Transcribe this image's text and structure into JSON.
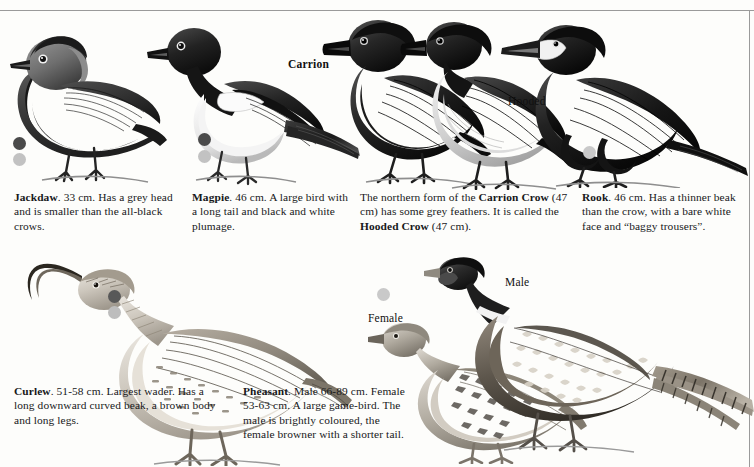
{
  "page": {
    "background_color": "#fdfdfb",
    "rule_color": "#9a9a9a"
  },
  "picture_labels": [
    {
      "id": "carrion",
      "text": "Carrion",
      "bold": true,
      "x": 288,
      "y": 58
    },
    {
      "id": "hooded",
      "text": "Hooded",
      "bold": false,
      "x": 508,
      "y": 95
    },
    {
      "id": "male",
      "text": "Male",
      "bold": false,
      "x": 505,
      "y": 276
    },
    {
      "id": "female",
      "text": "Female",
      "bold": false,
      "x": 368,
      "y": 312
    }
  ],
  "dots": [
    {
      "id": "jackdaw-dot-dark",
      "color": "#4a4a4a",
      "x": 13,
      "y": 137,
      "size": 13
    },
    {
      "id": "jackdaw-dot-light",
      "color": "#c2c2c2",
      "x": 13,
      "y": 153,
      "size": 13
    },
    {
      "id": "magpie-dot-dark",
      "color": "#4a4a4a",
      "x": 198,
      "y": 133,
      "size": 13
    },
    {
      "id": "magpie-dot-light",
      "color": "#c2c2c2",
      "x": 198,
      "y": 150,
      "size": 13
    },
    {
      "id": "rook-dot-light",
      "color": "#c9c9c9",
      "x": 583,
      "y": 146,
      "size": 13
    },
    {
      "id": "curlew-dot-dark",
      "color": "#585858",
      "x": 108,
      "y": 290,
      "size": 13
    },
    {
      "id": "curlew-dot-light",
      "color": "#bdbdbd",
      "x": 108,
      "y": 306,
      "size": 13
    },
    {
      "id": "pheasant-dot-light",
      "color": "#c9c9c9",
      "x": 377,
      "y": 288,
      "size": 13
    }
  ],
  "captions": {
    "jackdaw": {
      "x": 14,
      "y": 190,
      "width": 165,
      "name": "Jackdaw",
      "body": ". 33 cm. Has a grey head and is smaller than the all-black crows."
    },
    "magpie": {
      "x": 192,
      "y": 190,
      "width": 160,
      "name": "Magpie",
      "body": ". 46 cm. A large bird with a long tail and black and white plumage."
    },
    "crow": {
      "x": 360,
      "y": 190,
      "width": 212,
      "lead": "The northern form of the ",
      "name1": "Carrion Crow",
      "mid1": " (47 cm) has some grey feathers. It is called the ",
      "name2": "Hooded Crow",
      "tail": " (47 cm)."
    },
    "rook": {
      "x": 582,
      "y": 190,
      "width": 162,
      "name": "Rook",
      "body": ". 46 cm. Has a thinner beak than the crow, with a bare white face and “baggy trousers”."
    },
    "curlew": {
      "x": 14,
      "y": 384,
      "width": 200,
      "name": "Curlew",
      "body": ". 51-58 cm. Largest wader. Has a long downward curved beak, a brown body and long legs."
    },
    "pheasant": {
      "x": 243,
      "y": 384,
      "width": 160,
      "name": "Pheasant",
      "body": ". Male 66-89 cm. Female 53-63 cm. A large game-bird. The male is brightly coloured, the female browner with a shorter tail."
    }
  },
  "illustrations": [
    {
      "id": "jackdaw",
      "label": "jackdaw-illustration"
    },
    {
      "id": "magpie",
      "label": "magpie-illustration"
    },
    {
      "id": "carrion-crow",
      "label": "carrion-crow-illustration"
    },
    {
      "id": "hooded-crow",
      "label": "hooded-crow-illustration"
    },
    {
      "id": "rook",
      "label": "rook-illustration"
    },
    {
      "id": "curlew",
      "label": "curlew-illustration"
    },
    {
      "id": "pheasant-female",
      "label": "pheasant-female-illustration"
    },
    {
      "id": "pheasant-male",
      "label": "pheasant-male-illustration"
    }
  ]
}
